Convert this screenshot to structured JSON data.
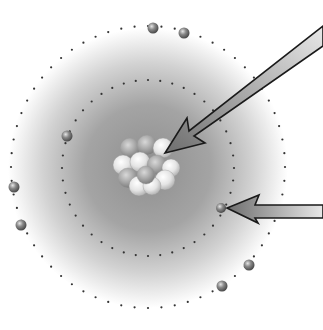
{
  "diagram": {
    "title": "",
    "type": "bohr-atom-model",
    "background": "#ffffff",
    "cloud": {
      "cx": 148,
      "cy": 168,
      "r": 140,
      "center_color": "#8e8e8e",
      "edge_color": "#ffffff"
    },
    "nucleus": {
      "cx": 146,
      "cy": 164,
      "particle_colors": [
        "#f0f0f0",
        "#bdbdbd"
      ],
      "particles": [
        {
          "x": 130,
          "y": 148,
          "r": 10,
          "shade": "dark"
        },
        {
          "x": 147,
          "y": 145,
          "r": 10,
          "shade": "dark"
        },
        {
          "x": 163,
          "y": 148,
          "r": 10,
          "shade": "light"
        },
        {
          "x": 123,
          "y": 165,
          "r": 10,
          "shade": "light"
        },
        {
          "x": 140,
          "y": 162,
          "r": 10,
          "shade": "light"
        },
        {
          "x": 157,
          "y": 165,
          "r": 10,
          "shade": "dark"
        },
        {
          "x": 171,
          "y": 168,
          "r": 9,
          "shade": "light"
        },
        {
          "x": 128,
          "y": 178,
          "r": 10,
          "shade": "dark"
        },
        {
          "x": 165,
          "y": 180,
          "r": 10,
          "shade": "light"
        },
        {
          "x": 139,
          "y": 186,
          "r": 10,
          "shade": "light"
        },
        {
          "x": 152,
          "y": 186,
          "r": 9,
          "shade": "light"
        },
        {
          "x": 146,
          "y": 175,
          "r": 9,
          "shade": "dark"
        }
      ]
    },
    "orbits": [
      {
        "name": "inner-shell",
        "cx": 148,
        "cy": 168,
        "rx": 86,
        "ry": 88,
        "dots": 44,
        "dot_color": "#333333"
      },
      {
        "name": "outer-shell",
        "cx": 148,
        "cy": 167,
        "rx": 137,
        "ry": 141,
        "dots": 64,
        "dot_color": "#333333"
      }
    ],
    "electrons": [
      {
        "shell": "outer",
        "x": 153,
        "y": 28,
        "r": 5.5
      },
      {
        "shell": "outer",
        "x": 184,
        "y": 33,
        "r": 5.5
      },
      {
        "shell": "inner",
        "x": 67,
        "y": 136,
        "r": 5.5
      },
      {
        "shell": "outer",
        "x": 14,
        "y": 187,
        "r": 5.5
      },
      {
        "shell": "outer",
        "x": 21,
        "y": 225,
        "r": 5.5
      },
      {
        "shell": "inner",
        "x": 221,
        "y": 208,
        "r": 5
      },
      {
        "shell": "outer",
        "x": 249,
        "y": 265,
        "r": 5.5
      },
      {
        "shell": "outer",
        "x": 222,
        "y": 286,
        "r": 5.5
      }
    ],
    "electron_colors": {
      "highlight": "#e6e6e6",
      "body": "#8a8a8a",
      "shadow": "#4a4a4a"
    },
    "arrows": [
      {
        "name": "nucleus-pointer-arrow",
        "points_to": "nucleus",
        "polygon": "323,26 323,46 194,136 205,143 165,153 187,118 189,131",
        "fill_start": "#6e6e6e",
        "fill_end": "#e8e8e8",
        "stroke": "#1a1a1a"
      },
      {
        "name": "electron-pointer-arrow",
        "points_to": "electron",
        "polygon": "323,205 323,218 255,218 258,223 227,208 259,195 255,205",
        "fill_start": "#6e6e6e",
        "fill_end": "#e8e8e8",
        "stroke": "#1a1a1a"
      }
    ]
  }
}
